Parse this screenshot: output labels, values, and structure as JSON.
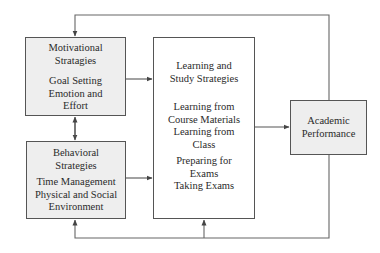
{
  "diagram": {
    "type": "flowchart",
    "boxes": {
      "motivational": {
        "title_lines": [
          "Motivational",
          "Stratagies"
        ],
        "items": [
          "Goal Setting",
          "Emotion and",
          "Effort"
        ],
        "fill": "#eeeeee"
      },
      "behavioral": {
        "title_lines": [
          "Behavioral",
          "Strategies"
        ],
        "items": [
          "Time Management",
          "Physical and Social",
          "Environment"
        ],
        "fill": "#eeeeee"
      },
      "learning": {
        "title_lines": [
          "Learning and",
          "Study Strategies"
        ],
        "items": [
          "Learning from",
          "Course Materials",
          "Learning from",
          "Class",
          "Preparing for",
          "Exams",
          "Taking Exams"
        ],
        "fill": "#ffffff"
      },
      "academic": {
        "title_lines": [
          "Academic",
          "Performance"
        ],
        "fill": "#eeeeee"
      }
    },
    "edges": [
      {
        "from": "motivational",
        "to": "learning",
        "style": "arrow"
      },
      {
        "from": "behavioral",
        "to": "learning",
        "style": "arrow"
      },
      {
        "from": "motivational",
        "to": "behavioral",
        "style": "bidirectional-arrow"
      },
      {
        "from": "learning",
        "to": "academic",
        "style": "arrow"
      },
      {
        "from": "academic",
        "to": "motivational",
        "style": "feedback-arrow-top"
      },
      {
        "from": "academic",
        "to": "behavioral",
        "style": "feedback-arrow-bottom"
      },
      {
        "from": "academic",
        "to": "learning",
        "style": "feedback-arrow-bottom"
      }
    ],
    "colors": {
      "line": "#555555",
      "box_border": "#555555",
      "shaded_fill": "#eeeeee",
      "text": "#2a2a2a"
    }
  }
}
